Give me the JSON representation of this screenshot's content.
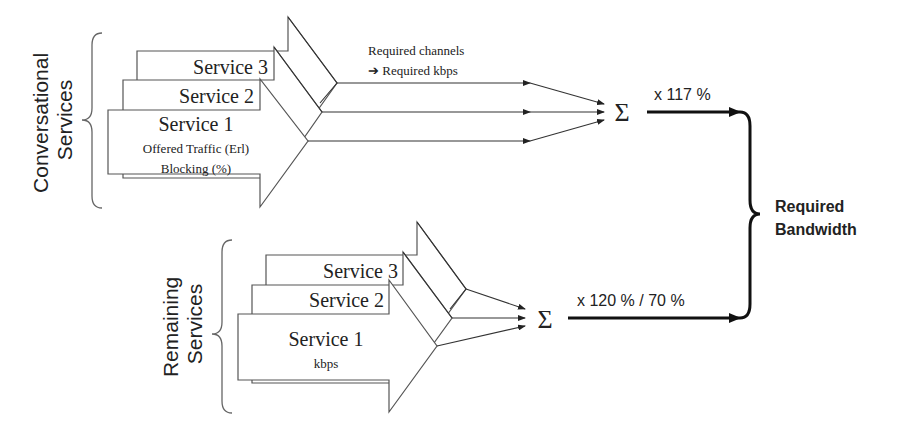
{
  "conversational": {
    "group_label_line1": "Conversational",
    "group_label_line2": "Services",
    "service3": "Service 3",
    "service2": "Service 2",
    "service1": "Service 1",
    "service1_detail1": "Offered Traffic (Erl)",
    "service1_detail2": "Blocking (%)",
    "annotation_line1": "Required channels",
    "annotation_line2": "➔ Required kbps",
    "sum_symbol": "Σ",
    "multiplier": "x 117 %"
  },
  "remaining": {
    "group_label_line1": "Remaining",
    "group_label_line2": "Services",
    "service3": "Service 3",
    "service2": "Service 2",
    "service1": "Service 1",
    "service1_detail1": "kbps",
    "sum_symbol": "Σ",
    "multiplier": "x 120 %  / 70 %"
  },
  "output": {
    "label_line1": "Required",
    "label_line2": "Bandwidth"
  }
}
